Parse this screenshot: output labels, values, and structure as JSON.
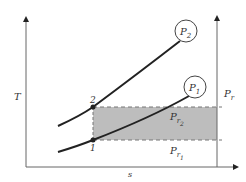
{
  "diagram": {
    "axes": {
      "y_label": "T",
      "x_label": "s",
      "right_axis_label": "P",
      "right_axis_sub": "r"
    },
    "curves": [
      {
        "name": "P",
        "sub": "2",
        "label": "P2"
      },
      {
        "name": "P",
        "sub": "1",
        "label": "P1"
      }
    ],
    "points": [
      {
        "label": "2"
      },
      {
        "label": "1"
      }
    ],
    "band_labels": [
      {
        "name": "P",
        "sub": "r",
        "subsub": "2"
      },
      {
        "name": "P",
        "sub": "r",
        "subsub": "1"
      }
    ],
    "colors": {
      "axis": "#666666",
      "curve": "#222222",
      "band_fill": "#bdbdbd",
      "dash": "#777777"
    }
  }
}
